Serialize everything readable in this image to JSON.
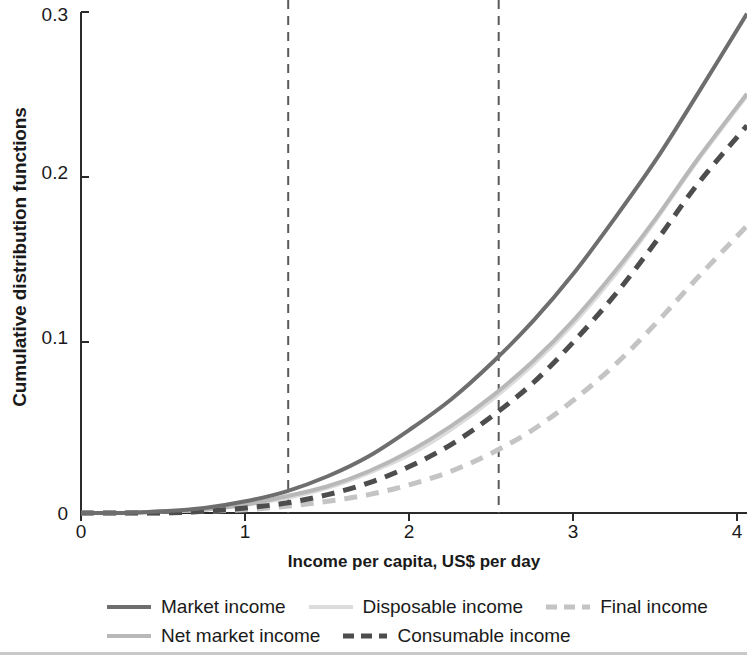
{
  "chart_data": {
    "type": "line",
    "title": "",
    "xlabel": "Income per capita, US$ per day",
    "ylabel": "Cumulative distribution functions",
    "xlim": [
      0,
      4.05
    ],
    "ylim": [
      0,
      0.3
    ],
    "xticks": [
      "0",
      "1",
      "2",
      "3",
      "4"
    ],
    "xtick_values": [
      0,
      1,
      2,
      3,
      4
    ],
    "yticks": [
      "0",
      "0.1",
      "0.2",
      "0.3"
    ],
    "ytick_values": [
      0,
      0.1,
      0.2,
      0.3
    ],
    "grid": false,
    "legend_position": "bottom",
    "annotations": [
      {
        "name": "poverty-line-1",
        "type": "vline",
        "x": 1.26,
        "style": "dashed",
        "color": "#595959"
      },
      {
        "name": "poverty-line-2",
        "type": "vline",
        "x": 2.54,
        "style": "dashed",
        "color": "#595959"
      }
    ],
    "x": [
      0,
      0.25,
      0.5,
      0.75,
      1.0,
      1.25,
      1.5,
      1.75,
      2.0,
      2.25,
      2.5,
      2.75,
      3.0,
      3.25,
      3.5,
      3.75,
      4.05
    ],
    "series": [
      {
        "name": "Market income",
        "color": "#6e6e6e",
        "style": "solid",
        "width": 4,
        "values": [
          0.0,
          0.0,
          0.001,
          0.003,
          0.007,
          0.013,
          0.022,
          0.034,
          0.05,
          0.068,
          0.09,
          0.115,
          0.144,
          0.177,
          0.212,
          0.251,
          0.299
        ]
      },
      {
        "name": "Net market income",
        "color": "#b8b8b8",
        "style": "solid",
        "width": 4,
        "values": [
          0.0,
          0.0,
          0.001,
          0.002,
          0.005,
          0.01,
          0.016,
          0.025,
          0.037,
          0.052,
          0.07,
          0.091,
          0.116,
          0.145,
          0.177,
          0.212,
          0.251
        ]
      },
      {
        "name": "Disposable income",
        "color": "#dcdcdc",
        "style": "solid",
        "width": 4,
        "values": [
          0.0,
          0.0,
          0.001,
          0.002,
          0.005,
          0.009,
          0.015,
          0.024,
          0.035,
          0.05,
          0.068,
          0.089,
          0.114,
          0.143,
          0.176,
          0.211,
          0.25
        ]
      },
      {
        "name": "Consumable income",
        "color": "#4d4d4d",
        "style": "dashed",
        "width": 5,
        "values": [
          0.0,
          0.0,
          0.0,
          0.001,
          0.003,
          0.006,
          0.011,
          0.018,
          0.028,
          0.041,
          0.058,
          0.078,
          0.103,
          0.131,
          0.163,
          0.197,
          0.232
        ]
      },
      {
        "name": "Final income",
        "color": "#c4c4c4",
        "style": "dashed",
        "width": 5,
        "values": [
          0.0,
          0.0,
          0.0,
          0.001,
          0.002,
          0.004,
          0.007,
          0.011,
          0.017,
          0.025,
          0.036,
          0.05,
          0.068,
          0.089,
          0.114,
          0.141,
          0.172
        ]
      }
    ]
  },
  "axes": {
    "ylabel": "Cumulative distribution functions",
    "xlabel": "Income per capita, US$ per day",
    "ytick_labels": [
      "0.3",
      "0.2",
      "0.1",
      "0"
    ],
    "xtick_labels": [
      "0",
      "1",
      "2",
      "3",
      "4"
    ]
  },
  "legend": {
    "row1": [
      {
        "label": "Market income",
        "color": "#6e6e6e",
        "style": "solid",
        "icon": "line-solid-icon"
      },
      {
        "label": "Disposable income",
        "color": "#dcdcdc",
        "style": "solid",
        "icon": "line-solid-icon"
      },
      {
        "label": "Final income",
        "color": "#c4c4c4",
        "style": "dashed",
        "icon": "line-dashed-icon"
      }
    ],
    "row2": [
      {
        "label": "Net market income",
        "color": "#b8b8b8",
        "style": "solid",
        "icon": "line-solid-icon"
      },
      {
        "label": "Consumable income",
        "color": "#4d4d4d",
        "style": "dashed",
        "icon": "line-dashed-icon"
      }
    ]
  },
  "colors": {
    "axis": "#2b2b2b",
    "text": "#1a1a1a",
    "background": "#ffffff",
    "vline": "#595959"
  }
}
